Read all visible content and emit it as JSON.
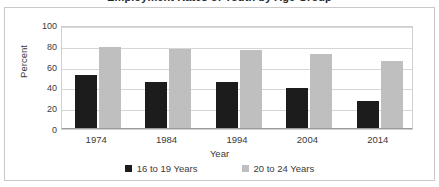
{
  "figure": {
    "cropped_title_fragment": "Employment Rates of Youth by Age Group",
    "border_color": "#c9c9c9",
    "background": "#ffffff"
  },
  "chart_data": {
    "type": "bar",
    "title": "",
    "xlabel": "Year",
    "ylabel": "Percent",
    "categories": [
      "1974",
      "1984",
      "1994",
      "2004",
      "2014"
    ],
    "series": [
      {
        "name": "16 to 19 Years",
        "color": "#1c1c1c",
        "values": [
          52,
          45,
          45,
          39,
          27
        ]
      },
      {
        "name": "20 to 24 Years",
        "color": "#bfbfbf",
        "values": [
          79,
          77,
          76,
          72,
          65
        ]
      }
    ],
    "ylim": [
      0,
      100
    ],
    "yticks": [
      100,
      80,
      60,
      40,
      20,
      0
    ],
    "grid": true,
    "legend_position": "bottom"
  }
}
